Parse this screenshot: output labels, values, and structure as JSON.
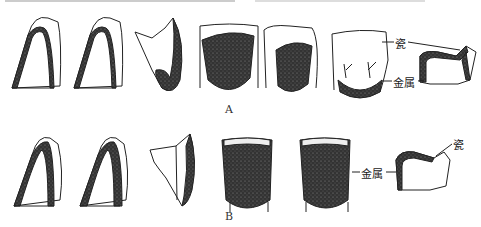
{
  "figure": {
    "colors": {
      "outline": "#222222",
      "metal_fill": "#2b2b2b",
      "background": "#ffffff"
    },
    "rows": [
      {
        "caption": "A",
        "items": [
          {
            "type": "cross-section",
            "desc": "anterior crown, thin metal coping under porcelain"
          },
          {
            "type": "cross-section",
            "desc": "anterior crown, metal coping"
          },
          {
            "type": "cross-section",
            "desc": "incisal section, metal on lingual"
          },
          {
            "type": "lingual-view",
            "desc": "metal covering most lingual surface"
          },
          {
            "type": "lingual-view",
            "desc": "metal on lingual, inset"
          },
          {
            "type": "lingual-view",
            "desc": "metal collar at cervical area"
          },
          {
            "type": "posterior-section",
            "desc": "posterior crown section"
          }
        ],
        "labels": {
          "porcelain": "瓷",
          "metal": "金属"
        }
      },
      {
        "caption": "B",
        "items": [
          {
            "type": "cross-section",
            "desc": "anterior crown, metal coping"
          },
          {
            "type": "cross-section",
            "desc": "anterior crown, thicker metal"
          },
          {
            "type": "cross-section",
            "desc": "incisal section, metal lingual"
          },
          {
            "type": "lingual-view",
            "desc": "full metal lingual, porcelain incisal edge"
          },
          {
            "type": "lingual-view",
            "desc": "full metal lingual, porcelain incisal edge"
          },
          {
            "type": "posterior-section",
            "desc": "posterior crown section"
          }
        ],
        "labels": {
          "metal": "金属",
          "porcelain": "瓷"
        }
      }
    ]
  }
}
